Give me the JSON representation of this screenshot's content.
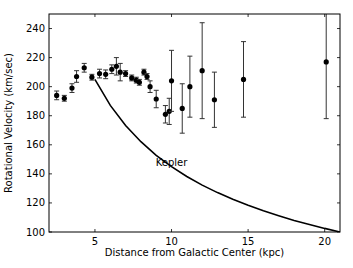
{
  "chart_data": {
    "type": "scatter",
    "title": "",
    "xlabel": "Distance from Galactic Center (kpc)",
    "ylabel": "Rotational Velocity (km/sec)",
    "xlim": [
      2.0,
      21.0
    ],
    "ylim": [
      100,
      250
    ],
    "xticks": [
      5,
      10,
      15,
      20
    ],
    "yticks": [
      100,
      120,
      140,
      160,
      180,
      200,
      220,
      240
    ],
    "grid": false,
    "legend": null,
    "annotations": [
      {
        "text": "Kepler",
        "x": 10.0,
        "y": 148
      }
    ],
    "series": [
      {
        "name": "Observed rotation velocity",
        "style": "points-with-errorbars",
        "color": "#000000",
        "points": [
          {
            "x": 2.5,
            "y": 194,
            "err": 3
          },
          {
            "x": 3.0,
            "y": 192,
            "err": 2
          },
          {
            "x": 3.5,
            "y": 199,
            "err": 3
          },
          {
            "x": 3.8,
            "y": 207,
            "err": 4
          },
          {
            "x": 4.3,
            "y": 213,
            "err": 3
          },
          {
            "x": 4.8,
            "y": 206.5,
            "err": 2
          },
          {
            "x": 5.3,
            "y": 209,
            "err": 3
          },
          {
            "x": 5.7,
            "y": 208.5,
            "err": 3
          },
          {
            "x": 6.1,
            "y": 212,
            "err": 3
          },
          {
            "x": 6.4,
            "y": 214,
            "err": 6
          },
          {
            "x": 6.65,
            "y": 210,
            "err": 6
          },
          {
            "x": 7.0,
            "y": 209,
            "err": 2
          },
          {
            "x": 7.4,
            "y": 206,
            "err": 2
          },
          {
            "x": 7.7,
            "y": 204.5,
            "err": 2
          },
          {
            "x": 7.9,
            "y": 203,
            "err": 2
          },
          {
            "x": 8.2,
            "y": 210,
            "err": 2
          },
          {
            "x": 8.4,
            "y": 207,
            "err": 2
          },
          {
            "x": 8.6,
            "y": 200,
            "err": 4
          },
          {
            "x": 9.0,
            "y": 191.5,
            "err": 6
          },
          {
            "x": 9.6,
            "y": 181,
            "err": 6
          },
          {
            "x": 9.85,
            "y": 183,
            "err": 9
          },
          {
            "x": 10.0,
            "y": 204,
            "err": 21
          },
          {
            "x": 10.7,
            "y": 185,
            "err": 17
          },
          {
            "x": 11.2,
            "y": 200,
            "err": 21
          },
          {
            "x": 12.0,
            "y": 211,
            "err": 33
          },
          {
            "x": 12.8,
            "y": 191,
            "err": 19
          },
          {
            "x": 14.7,
            "y": 205,
            "err": 26
          },
          {
            "x": 20.1,
            "y": 217,
            "err": 39
          }
        ]
      },
      {
        "name": "Kepler",
        "style": "line",
        "color": "#000000",
        "formula": "v = 205 * sqrt(5 / r)",
        "x": [
          5.0,
          6,
          7,
          8,
          9,
          10,
          11,
          12,
          13,
          14,
          15,
          16,
          17,
          18,
          19,
          20,
          21
        ],
        "y": [
          205,
          187.1,
          173.3,
          162.1,
          152.8,
          145.0,
          138.2,
          132.3,
          127.1,
          122.5,
          118.4,
          114.6,
          111.2,
          108.0,
          105.2,
          102.5,
          100.0
        ]
      }
    ]
  }
}
